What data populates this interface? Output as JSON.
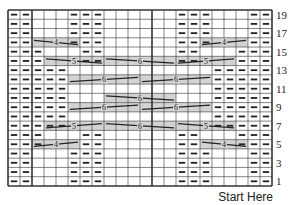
{
  "chart_data": {
    "type": "table",
    "columns": 22,
    "rows": 19,
    "row_labels": [
      "1",
      "3",
      "5",
      "7",
      "9",
      "11",
      "13",
      "15",
      "17",
      "19"
    ],
    "footer_label": "Start Here",
    "legend_note": "dash = purl stitch; shaded bar with number = cable crossing over N stitches",
    "purl_cells": {
      "19": [
        1,
        2,
        6,
        7,
        8,
        15,
        16,
        17,
        21,
        22
      ],
      "18": [
        1,
        2,
        6,
        7,
        8,
        15,
        16,
        17,
        21,
        22
      ],
      "17": [
        1,
        2,
        6,
        7,
        8,
        15,
        16,
        17,
        21,
        22
      ],
      "16": [
        1,
        2,
        6,
        7,
        8,
        15,
        16,
        17,
        21,
        22
      ],
      "15": [
        1,
        2,
        3,
        7,
        8,
        15,
        16,
        20,
        21,
        22
      ],
      "14": [
        1,
        2,
        3,
        7,
        8,
        15,
        16,
        20,
        21,
        22
      ],
      "13": [
        1,
        2,
        3,
        4,
        5,
        18,
        19,
        20,
        21,
        22
      ],
      "12": [
        1,
        2,
        3,
        4,
        5,
        18,
        19,
        20,
        21,
        22
      ],
      "11": [
        1,
        2,
        3,
        4,
        5,
        18,
        19,
        20,
        21,
        22
      ],
      "10": [
        1,
        2,
        3,
        4,
        5,
        18,
        19,
        20,
        21,
        22
      ],
      "9": [
        1,
        2,
        3,
        4,
        5,
        18,
        19,
        20,
        21,
        22
      ],
      "8": [
        1,
        2,
        3,
        4,
        5,
        18,
        19,
        20,
        21,
        22
      ],
      "7": [
        1,
        2,
        3,
        4,
        5,
        18,
        19,
        20,
        21,
        22
      ],
      "6": [
        1,
        2,
        3,
        7,
        8,
        15,
        16,
        20,
        21,
        22
      ],
      "5": [
        1,
        2,
        3,
        7,
        8,
        15,
        16,
        20,
        21,
        22
      ],
      "4": [
        1,
        2,
        6,
        7,
        8,
        15,
        16,
        17,
        21,
        22
      ],
      "3": [
        1,
        2,
        6,
        7,
        8,
        15,
        16,
        17,
        21,
        22
      ],
      "2": [
        1,
        2,
        6,
        7,
        8,
        15,
        16,
        17,
        21,
        22
      ],
      "1": [
        1,
        2,
        6,
        7,
        8,
        15,
        16,
        17,
        21,
        22
      ]
    },
    "cables": [
      {
        "row": 16,
        "start": 3,
        "end": 6,
        "label": "4",
        "dir": "down"
      },
      {
        "row": 16,
        "start": 17,
        "end": 20,
        "label": "4",
        "dir": "up"
      },
      {
        "row": 14,
        "start": 4,
        "end": 8,
        "label": "5",
        "dir": "down"
      },
      {
        "row": 14,
        "start": 9,
        "end": 14,
        "label": "6",
        "dir": "down"
      },
      {
        "row": 14,
        "start": 15,
        "end": 19,
        "label": "5",
        "dir": "up"
      },
      {
        "row": 12,
        "start": 6,
        "end": 11,
        "label": "6",
        "dir": "up"
      },
      {
        "row": 12,
        "start": 12,
        "end": 17,
        "label": "6",
        "dir": "up"
      },
      {
        "row": 10,
        "start": 9,
        "end": 14,
        "label": "6",
        "dir": "down"
      },
      {
        "row": 9,
        "start": 6,
        "end": 11,
        "label": "6",
        "dir": "up"
      },
      {
        "row": 9,
        "start": 12,
        "end": 17,
        "label": "6",
        "dir": "up"
      },
      {
        "row": 7,
        "start": 4,
        "end": 8,
        "label": "5",
        "dir": "up"
      },
      {
        "row": 7,
        "start": 9,
        "end": 14,
        "label": "6",
        "dir": "down"
      },
      {
        "row": 7,
        "start": 15,
        "end": 19,
        "label": "5",
        "dir": "down"
      },
      {
        "row": 5,
        "start": 3,
        "end": 6,
        "label": "4",
        "dir": "up"
      },
      {
        "row": 5,
        "start": 17,
        "end": 20,
        "label": "4",
        "dir": "down"
      }
    ],
    "thick_column_lines_after": [
      2,
      12
    ],
    "colors": {
      "grid": "#333333",
      "shade": "#d3d3d3",
      "ink": "#222222"
    }
  }
}
